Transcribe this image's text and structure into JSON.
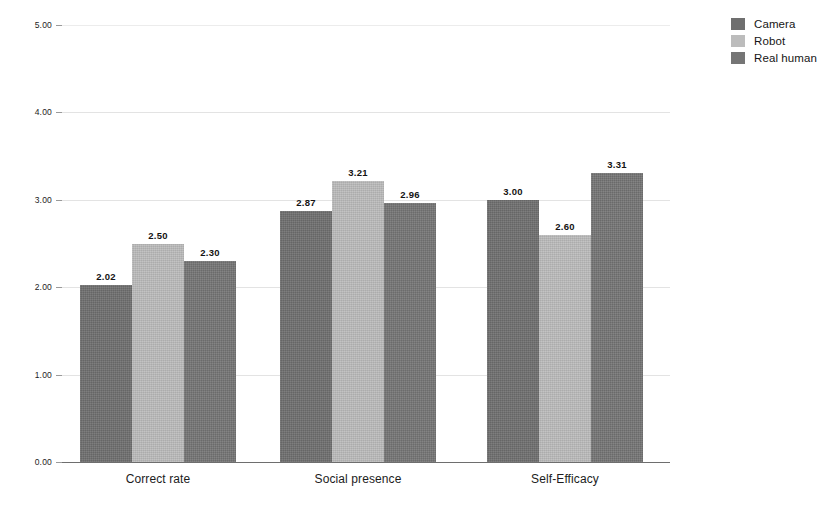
{
  "chart_data": {
    "type": "bar",
    "title": "",
    "subtitle": "",
    "xlabel": "",
    "ylabel": "",
    "categories": [
      "Correct rate",
      "Social presence",
      "Self-Efficacy"
    ],
    "series": [
      {
        "name": "Camera",
        "color": "#6f6f6f",
        "values": [
          2.02,
          2.87,
          3.0
        ],
        "labels": [
          "2.02",
          "2.87",
          "3.00"
        ]
      },
      {
        "name": "Robot",
        "color": "#bcbcbc",
        "values": [
          2.5,
          3.21,
          2.6
        ],
        "labels": [
          "2.50",
          "3.21",
          "2.60"
        ]
      },
      {
        "name": "Real human",
        "color": "#757575",
        "values": [
          2.3,
          2.96,
          3.31
        ],
        "labels": [
          "2.30",
          "2.96",
          "3.31"
        ]
      }
    ],
    "ylim": [
      0,
      5
    ],
    "yticks": [
      0,
      1,
      2,
      3,
      4,
      5
    ],
    "ytick_labels": [
      "0.00",
      "1.00",
      "2.00",
      "3.00",
      "4.00",
      "5.00"
    ],
    "grid": true,
    "grid_color": "#e8e8e8",
    "axis_color": "#6e6e6e",
    "legend_position": "top-right",
    "data_labels": true
  },
  "legend": {
    "entries": [
      {
        "label": "Camera",
        "color": "#6f6f6f"
      },
      {
        "label": "Robot",
        "color": "#bcbcbc"
      },
      {
        "label": "Real human",
        "color": "#757575"
      }
    ]
  },
  "axes": {
    "y": {
      "ticks": [
        {
          "label": "5.00",
          "value": 5
        },
        {
          "label": "4.00",
          "value": 4
        },
        {
          "label": "3.00",
          "value": 3
        },
        {
          "label": "2.00",
          "value": 2
        },
        {
          "label": "1.00",
          "value": 1
        },
        {
          "label": "0.00",
          "value": 0
        }
      ]
    },
    "x": {
      "ticks": [
        {
          "label": "Correct rate"
        },
        {
          "label": "Social presence"
        },
        {
          "label": "Self-Efficacy"
        }
      ]
    }
  }
}
